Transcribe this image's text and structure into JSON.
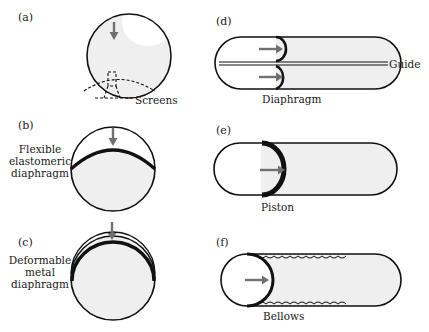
{
  "figure": {
    "panels": [
      {
        "id": "a",
        "tag": "(a)",
        "caption": "",
        "callout": "Screens",
        "type": "sphere-with-screens"
      },
      {
        "id": "b",
        "tag": "(b)",
        "caption_lines": [
          "Flexible",
          "elastomeric",
          "diaphragm"
        ],
        "type": "sphere-with-elastomeric-diaphragm"
      },
      {
        "id": "c",
        "tag": "(c)",
        "caption_lines": [
          "Deformable",
          "metal",
          "diaphragm"
        ],
        "type": "sphere-with-metal-diaphragm"
      },
      {
        "id": "d",
        "tag": "(d)",
        "callout_right": "Guide",
        "callout_bottom": "Diaphragm",
        "type": "cylinder-with-rolling-diaphragms"
      },
      {
        "id": "e",
        "tag": "(e)",
        "callout_bottom": "Piston",
        "type": "cylinder-with-piston"
      },
      {
        "id": "f",
        "tag": "(f)",
        "callout_bottom": "Bellows",
        "type": "cylinder-with-bellows"
      }
    ],
    "colors": {
      "outline": "#111111",
      "fill_propellant": "#efefef",
      "arrow": "#707070",
      "background": "#ffffff"
    }
  }
}
